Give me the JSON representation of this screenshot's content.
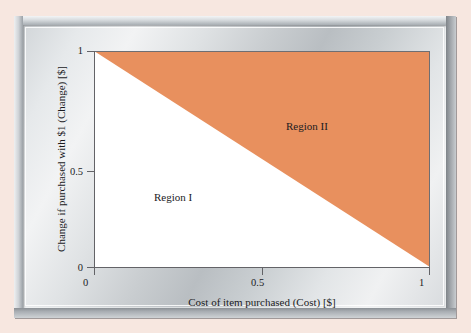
{
  "figure": {
    "background_color": "#f7e7e0",
    "frame_style": "metallic-silver-bevel",
    "panel_style": "brushed-metal-gradient"
  },
  "chart_data": {
    "type": "area",
    "title": "",
    "subtitle": "",
    "xlabel": "Cost of item purchased (Cost) [$]",
    "ylabel": "Change if purchased with $1 (Change) [$]",
    "xlim": [
      0,
      1
    ],
    "ylim": [
      0,
      1
    ],
    "xticks": [
      "0",
      "0.5",
      "1"
    ],
    "xtick_values": [
      0,
      0.5,
      1
    ],
    "yticks": [
      "0",
      "0.5",
      "1"
    ],
    "ytick_values": [
      0,
      0.5,
      1
    ],
    "grid": false,
    "legend": "none",
    "series": [
      {
        "name": "Change = 1 - Cost",
        "type": "line",
        "x": [
          0,
          1
        ],
        "values": [
          1,
          0
        ],
        "description": "Boundary line from (0,1) to (1,0) separating Region I and Region II"
      }
    ],
    "regions": [
      {
        "name": "Region I",
        "label": "Region I",
        "fill_color": "#ffffff",
        "polygon": [
          [
            0,
            0
          ],
          [
            1,
            0
          ],
          [
            0,
            1
          ]
        ],
        "condition": "Change + Cost < 1",
        "label_position": [
          0.18,
          0.35
        ]
      },
      {
        "name": "Region II",
        "label": "Region II",
        "fill_color": "#e8905e",
        "polygon": [
          [
            0,
            1
          ],
          [
            1,
            1
          ],
          [
            1,
            0
          ]
        ],
        "condition": "Change + Cost > 1",
        "label_position": [
          0.57,
          0.68
        ]
      }
    ],
    "annotations": [
      {
        "text": "Region I",
        "x": 0.18,
        "y": 0.35
      },
      {
        "text": "Region II",
        "x": 0.57,
        "y": 0.68
      }
    ],
    "colors": {
      "region_two": "#e8905e",
      "region_one": "#ffffff",
      "axis": "#636367",
      "boundary": "#e8905e",
      "text": "#1b1b1e"
    }
  }
}
